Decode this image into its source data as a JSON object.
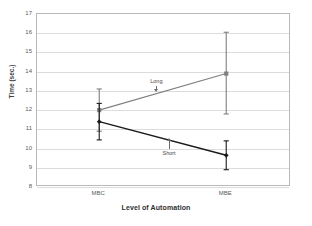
{
  "chart_data": {
    "type": "line",
    "title": "",
    "subtitle": "",
    "xlabel": "Level of Automation",
    "ylabel": "Time (sec.)",
    "categories": [
      "MBC",
      "MBE"
    ],
    "ylim": [
      8,
      17
    ],
    "yticks": [
      17,
      16,
      15,
      14,
      13,
      12,
      11,
      10,
      9,
      8
    ],
    "ytick_labels": [
      "17",
      "16",
      "15",
      "14",
      "13",
      "12",
      "11",
      "10",
      "9",
      "8"
    ],
    "grid": "horizontal",
    "legend": "inline-annotations",
    "series": [
      {
        "name": "Long",
        "color": "#7f7f7f",
        "marker": "square",
        "values": [
          12.0,
          13.9
        ],
        "error_low": [
          10.9,
          11.8
        ],
        "error_high": [
          13.1,
          16.05
        ]
      },
      {
        "name": "Short",
        "color": "#1a1a1a",
        "marker": "diamond",
        "values": [
          11.4,
          9.65
        ],
        "error_low": [
          10.45,
          8.9
        ],
        "error_high": [
          12.35,
          10.4
        ]
      }
    ],
    "annotations": [
      {
        "text": "Long",
        "x_value": 0.47,
        "y_value": 13.45,
        "points_to": 12.95,
        "direction": "down"
      },
      {
        "text": "Short",
        "x_value": 0.52,
        "y_value": 9.95,
        "points_to": 10.55,
        "direction": "up"
      }
    ]
  },
  "axes": {
    "y_title": "Time (sec.)",
    "x_title": "Level of Automation"
  },
  "colors": {
    "frame": "#b9b9b9",
    "grid": "#dcdcdc",
    "long_series": "#7f7f7f",
    "short_series": "#1a1a1a",
    "background": "#ffffff"
  }
}
